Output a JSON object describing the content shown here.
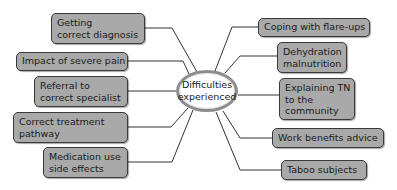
{
  "diagram": {
    "type": "mind-map",
    "center": {
      "line1": "Difficulties",
      "line2": "experienced"
    },
    "left_nodes": [
      {
        "lines": [
          "Getting",
          "correct diagnosis"
        ]
      },
      {
        "lines": [
          "Impact of severe pain"
        ]
      },
      {
        "lines": [
          "Referral to",
          "correct specialist"
        ]
      },
      {
        "lines": [
          "Correct treatment",
          "pathway"
        ]
      },
      {
        "lines": [
          "Medication use",
          "side effects"
        ]
      }
    ],
    "right_nodes": [
      {
        "lines": [
          "Coping with flare-ups"
        ]
      },
      {
        "lines": [
          "Dehydration",
          "malnutrition"
        ]
      },
      {
        "lines": [
          "Explaining TN",
          "to the",
          "community"
        ]
      },
      {
        "lines": [
          "Work benefits advice"
        ]
      },
      {
        "lines": [
          "Taboo subjects"
        ]
      }
    ],
    "colors": {
      "node_fill": "#a9a9a9",
      "node_border": "#3a3a3a",
      "center_border": "#8c8c8c",
      "line": "#333333"
    }
  }
}
